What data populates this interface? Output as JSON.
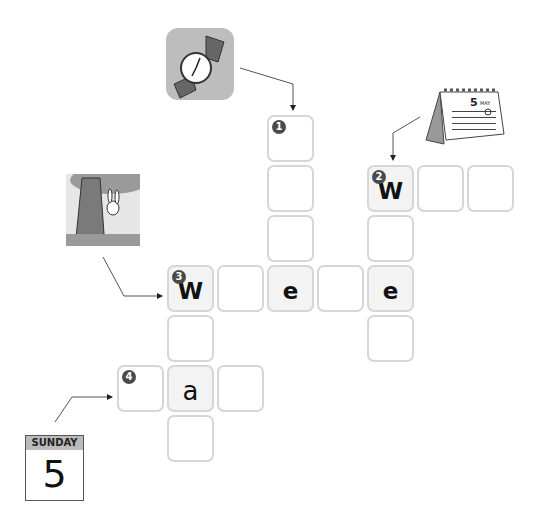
{
  "puzzle": {
    "type": "crossword",
    "clues": [
      {
        "number": "1",
        "direction": "down",
        "picture": "wristwatch",
        "length": 4
      },
      {
        "number": "2",
        "direction": "across",
        "picture": "desk-calendar-may-5",
        "length": 3
      },
      {
        "number": "3",
        "direction": "across",
        "picture": "rabbit-behind-tree",
        "length": 5
      },
      {
        "number": "4",
        "direction": "across",
        "picture": "sunday-calendar-page",
        "length": 3
      }
    ],
    "cells": [
      {
        "x": 267,
        "y": 115,
        "letter": "",
        "num": "1"
      },
      {
        "x": 267,
        "y": 165,
        "letter": ""
      },
      {
        "x": 267,
        "y": 215,
        "letter": ""
      },
      {
        "x": 367,
        "y": 165,
        "letter": "W",
        "num": "2"
      },
      {
        "x": 417,
        "y": 165,
        "letter": ""
      },
      {
        "x": 467,
        "y": 165,
        "letter": ""
      },
      {
        "x": 367,
        "y": 215,
        "letter": ""
      },
      {
        "x": 167,
        "y": 265,
        "letter": "W",
        "num": "3"
      },
      {
        "x": 217,
        "y": 265,
        "letter": ""
      },
      {
        "x": 267,
        "y": 265,
        "letter": "e"
      },
      {
        "x": 317,
        "y": 265,
        "letter": ""
      },
      {
        "x": 367,
        "y": 265,
        "letter": "e"
      },
      {
        "x": 367,
        "y": 315,
        "letter": ""
      },
      {
        "x": 167,
        "y": 315,
        "letter": ""
      },
      {
        "x": 117,
        "y": 365,
        "letter": "",
        "num": "4"
      },
      {
        "x": 167,
        "y": 365,
        "letter": "a"
      },
      {
        "x": 217,
        "y": 365,
        "letter": ""
      },
      {
        "x": 167,
        "y": 415,
        "letter": ""
      }
    ]
  },
  "pictures": {
    "sunday_calendar": {
      "day_label": "SUNDAY",
      "date": "5"
    },
    "desk_calendar": {
      "date": "5",
      "month": "MAY"
    }
  },
  "colors": {
    "cell_border": "#d6d6d6",
    "given_bg": "#f3f3f3",
    "badge": "#4a4a4a"
  }
}
